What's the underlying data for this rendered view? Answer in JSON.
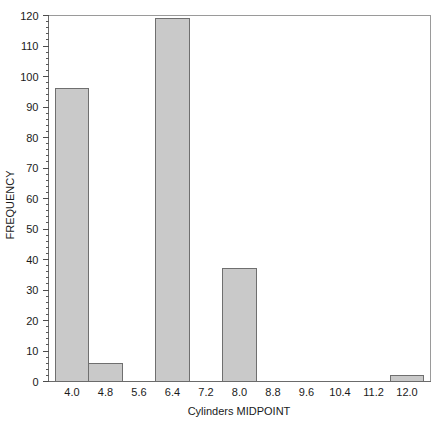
{
  "chart_data": {
    "type": "bar",
    "title": "",
    "subtitle": "",
    "xlabel": "Cylinders MIDPOINT",
    "ylabel": "FREQUENCY",
    "categories": [
      "4.0",
      "4.8",
      "5.6",
      "6.4",
      "7.2",
      "8.0",
      "8.8",
      "9.6",
      "10.4",
      "11.2",
      "12.0"
    ],
    "values": [
      96,
      6,
      0,
      119,
      0,
      37,
      0,
      0,
      0,
      0,
      2
    ],
    "xlim": [
      3.6,
      12.4
    ],
    "ylim": [
      0,
      120
    ],
    "ytick_labels": [
      "0",
      "10",
      "20",
      "30",
      "40",
      "50",
      "60",
      "70",
      "80",
      "90",
      "100",
      "110",
      "120"
    ],
    "ytick_values": [
      0,
      10,
      20,
      30,
      40,
      50,
      60,
      70,
      80,
      90,
      100,
      110,
      120
    ],
    "yminor_step": 2,
    "xtick_labels": [
      "4.0",
      "4.8",
      "5.6",
      "6.4",
      "7.2",
      "8.0",
      "8.8",
      "9.6",
      "10.4",
      "11.2",
      "12.0"
    ],
    "grid": "off",
    "legend": "none",
    "bar_fill": "#c9c9c9",
    "bar_stroke": "#6f6f6f",
    "axis_color": "#4d4d4d",
    "background": "#ffffff"
  },
  "axes": {
    "y_title": "FREQUENCY",
    "x_title": "Cylinders MIDPOINT"
  }
}
